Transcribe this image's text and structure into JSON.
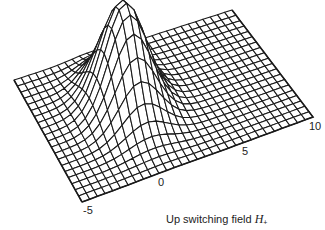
{
  "chart_data": {
    "type": "surface",
    "title": "",
    "xlabel": "Up switching field H+",
    "xlabel_text": "Up switching field ",
    "xlabel_symbol": "H",
    "xlabel_subscript": "+",
    "x_ticks": [
      "-5",
      "0",
      "5",
      "10"
    ],
    "x_range": [
      -5,
      10
    ],
    "y_ticks": [],
    "z_ticks": [],
    "grid": {
      "cols": 30,
      "rows": 20
    },
    "peak": {
      "u": 0.36,
      "v": 0.56,
      "sigma_u": 0.09,
      "sigma_v": 0.17,
      "height_px": 104
    },
    "corners_px": {
      "front_left": [
        82,
        202
      ],
      "front_right": [
        313,
        117
      ],
      "back_right": [
        232,
        10
      ],
      "back_left": [
        14,
        80
      ]
    },
    "style": {
      "line_color": "#1a1a1a",
      "background": "#ffffff"
    }
  }
}
